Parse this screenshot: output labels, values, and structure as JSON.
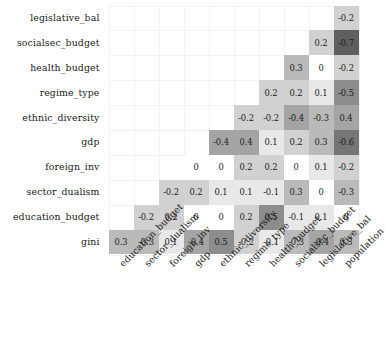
{
  "chart_data": {
    "type": "heatmap",
    "title": "",
    "xlabel": "",
    "ylabel": "",
    "grid": true,
    "legend": "none",
    "colormap": "grayscale-by-absolute-value",
    "value_range": [
      -0.7,
      0.5
    ],
    "shape": "lower-triangular",
    "x_categories": [
      "education_budget",
      "sector_dualism",
      "foreign_inv",
      "gdp",
      "ethnic_diversity",
      "regime_type",
      "health_budget",
      "socialsec_budget",
      "legislative_bal",
      "population"
    ],
    "y_categories": [
      "legislative_bal",
      "socialsec_budget",
      "health_budget",
      "regime_type",
      "ethnic_diversity",
      "gdp",
      "foreign_inv",
      "sector_dualism",
      "education_budget",
      "gini"
    ],
    "rows": [
      {
        "name": "legislative_bal",
        "start_col": 9,
        "values": [
          -0.2
        ]
      },
      {
        "name": "socialsec_budget",
        "start_col": 8,
        "values": [
          0.2,
          -0.7
        ]
      },
      {
        "name": "health_budget",
        "start_col": 7,
        "values": [
          0.3,
          0,
          -0.2
        ]
      },
      {
        "name": "regime_type",
        "start_col": 6,
        "values": [
          0.2,
          0.2,
          0.1,
          -0.5
        ]
      },
      {
        "name": "ethnic_diversity",
        "start_col": 5,
        "values": [
          -0.2,
          -0.2,
          -0.4,
          -0.3,
          0.4
        ]
      },
      {
        "name": "gdp",
        "start_col": 4,
        "values": [
          -0.4,
          0.4,
          0.1,
          0.2,
          0.3,
          -0.6
        ]
      },
      {
        "name": "foreign_inv",
        "start_col": 3,
        "values": [
          0,
          0,
          0.2,
          0.2,
          0,
          0.1,
          -0.2
        ]
      },
      {
        "name": "sector_dualism",
        "start_col": 2,
        "values": [
          -0.2,
          0.2,
          0.1,
          0.1,
          -0.1,
          0.3,
          0,
          -0.3
        ]
      },
      {
        "name": "education_budget",
        "start_col": 1,
        "values": [
          -0.2,
          0.2,
          0,
          0,
          0.2,
          0.5,
          -0.1,
          0.1,
          0
        ]
      },
      {
        "name": "gini",
        "start_col": 0,
        "values": [
          0.3,
          -0.3,
          0.1,
          -0.4,
          0.5,
          -0.2,
          -0.1,
          -0.3,
          -0.4,
          0.3
        ]
      }
    ],
    "cell_labels": [
      [
        "-0.2"
      ],
      [
        "0.2",
        "-0.7"
      ],
      [
        "0.3",
        "0",
        "-0.2"
      ],
      [
        "0.2",
        "0.2",
        "0.1",
        "-0.5"
      ],
      [
        "-0.2",
        "-0.2",
        "-0.4",
        "-0.3",
        "0.4"
      ],
      [
        "-0.4",
        "0.4",
        "0.1",
        "0.2",
        "0.3",
        "-0.6"
      ],
      [
        "0",
        "0",
        "0.2",
        "0.2",
        "0",
        "0.1",
        "-0.2"
      ],
      [
        "-0.2",
        "0.2",
        "0.1",
        "0.1",
        "-0.1",
        "0.3",
        "0",
        "-0.3"
      ],
      [
        "-0.2",
        "0.2",
        "0",
        "0",
        "0.2",
        "0.5",
        "-0.1",
        "0.1",
        "0"
      ],
      [
        "0.3",
        "-0.3",
        "0.1",
        "-0.4",
        "0.5",
        "-0.2",
        "-0.1",
        "-0.3",
        "-0.4",
        "0.3"
      ]
    ]
  },
  "colors": {
    "background": "#ffffff",
    "text": "#1a1a1a",
    "gridline": "#f2f2f2",
    "cell_min": "#ffffff",
    "cell_max": "#5f5f5f"
  }
}
